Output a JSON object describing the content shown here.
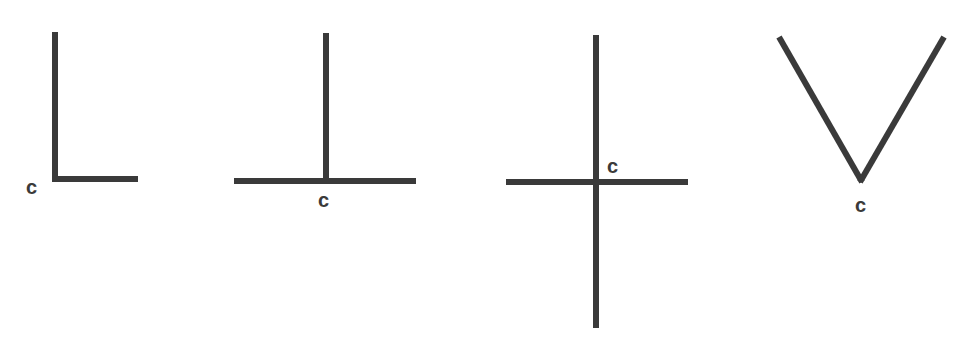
{
  "diagram": {
    "stroke_color": "#3a3a3a",
    "figures": [
      {
        "name": "L-junction",
        "corner_label": "c",
        "segments": [
          {
            "x1": 55,
            "y1": 32,
            "x2": 55,
            "y2": 180
          },
          {
            "x1": 52,
            "y1": 179,
            "x2": 138,
            "y2": 179
          }
        ],
        "label_pos": {
          "x": 26,
          "y": 194
        }
      },
      {
        "name": "T-junction",
        "corner_label": "c",
        "segments": [
          {
            "x1": 326,
            "y1": 33,
            "x2": 326,
            "y2": 181
          },
          {
            "x1": 234,
            "y1": 181,
            "x2": 416,
            "y2": 181
          }
        ],
        "label_pos": {
          "x": 318,
          "y": 207
        }
      },
      {
        "name": "X-junction",
        "corner_label": "c",
        "segments": [
          {
            "x1": 596,
            "y1": 35,
            "x2": 596,
            "y2": 328
          },
          {
            "x1": 506,
            "y1": 182,
            "x2": 688,
            "y2": 182
          }
        ],
        "label_pos": {
          "x": 607,
          "y": 173
        }
      },
      {
        "name": "V-junction",
        "corner_label": "c",
        "segments": [
          {
            "x1": 779,
            "y1": 37,
            "x2": 862,
            "y2": 182
          },
          {
            "x1": 944,
            "y1": 37,
            "x2": 860,
            "y2": 182
          }
        ],
        "label_pos": {
          "x": 855,
          "y": 212
        }
      }
    ]
  }
}
